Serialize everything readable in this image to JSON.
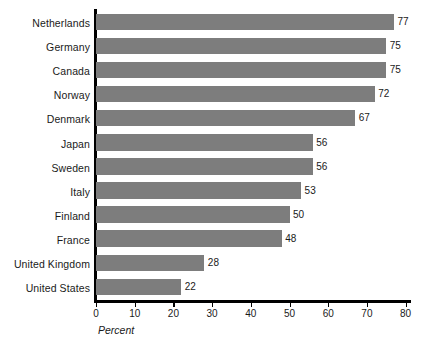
{
  "chart_data": {
    "type": "bar",
    "orientation": "horizontal",
    "title": "",
    "subtitle": "",
    "xlabel": "Percent",
    "ylabel": "",
    "xlim": [
      0,
      80
    ],
    "xticks": [
      0,
      10,
      20,
      30,
      40,
      50,
      60,
      70,
      80
    ],
    "xtick_labels": [
      "0",
      "10",
      "20",
      "30",
      "40",
      "50",
      "60",
      "70",
      "80"
    ],
    "grid": false,
    "legend": null,
    "bar_color": "#7d7d7d",
    "axis_color": "#000000",
    "text_color": "#1a1a1a",
    "show_value_labels": true,
    "categories": [
      "Netherlands",
      "Germany",
      "Canada",
      "Norway",
      "Denmark",
      "Japan",
      "Sweden",
      "Italy",
      "Finland",
      "France",
      "United Kingdom",
      "United States"
    ],
    "values": [
      77,
      75,
      75,
      72,
      67,
      56,
      56,
      53,
      50,
      48,
      28,
      22
    ],
    "value_labels": [
      "77",
      "75",
      "75",
      "72",
      "67",
      "56",
      "56",
      "53",
      "50",
      "48",
      "28",
      "22"
    ]
  }
}
